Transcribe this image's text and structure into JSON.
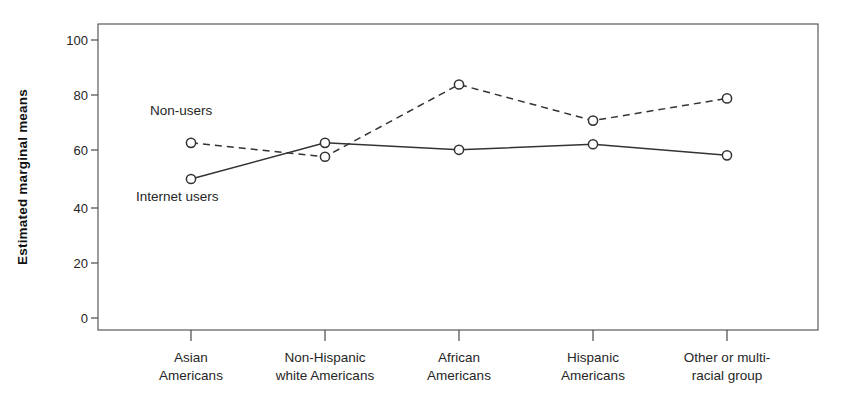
{
  "chart_data": {
    "type": "line",
    "title": "",
    "xlabel": "",
    "ylabel": "Estimated marginal means",
    "ylim": [
      0,
      100
    ],
    "yticks": [
      0,
      20,
      40,
      60,
      80,
      100
    ],
    "ytick_labels": [
      "0",
      "20",
      "40",
      "60",
      "80",
      "100"
    ],
    "grid": false,
    "legend_position": "inline-annotations",
    "categories": [
      "Asian\nAmericans",
      "Non-Hispanic\nwhite Americans",
      "African\nAmericans",
      "Hispanic\nAmericans",
      "Other or multi-\nracial group"
    ],
    "category_lines": [
      [
        "Asian",
        "Americans"
      ],
      [
        "Non-Hispanic",
        "white Americans"
      ],
      [
        "African",
        "Americans"
      ],
      [
        "Hispanic",
        "Americans"
      ],
      [
        "Other or multi-",
        "racial group"
      ]
    ],
    "series": [
      {
        "name": "Non-users",
        "style": "dashed",
        "marker": "open-circle",
        "color": "#333333",
        "values": [
          63,
          58,
          84,
          71,
          79
        ]
      },
      {
        "name": "Internet users",
        "style": "solid",
        "marker": "open-circle",
        "color": "#333333",
        "values": [
          50,
          63,
          60.5,
          62.5,
          58.5
        ]
      }
    ],
    "annotations": [
      {
        "text": "Non-users",
        "x_category_index": 0,
        "value": 74
      },
      {
        "text": "Internet users",
        "x_category_index": 0,
        "value": 39
      }
    ]
  },
  "axis": {
    "y_title": "Estimated marginal means"
  },
  "colors": {
    "ink": "#333333",
    "frame": "#5a5a5a",
    "background": "#ffffff"
  }
}
